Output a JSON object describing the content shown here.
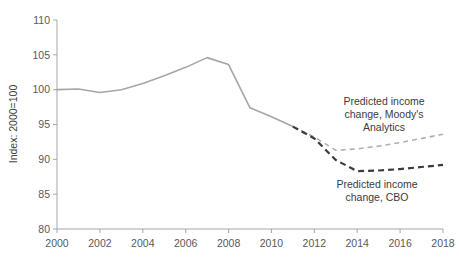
{
  "chart_data": {
    "type": "line",
    "title": "",
    "xlabel": "",
    "ylabel": "Index: 2000=100",
    "xlim": [
      2000,
      2018
    ],
    "ylim": [
      80,
      110
    ],
    "yticks": [
      80,
      85,
      90,
      95,
      100,
      105,
      110
    ],
    "xticks": [
      2000,
      2002,
      2004,
      2006,
      2008,
      2010,
      2012,
      2014,
      2016,
      2018
    ],
    "grid": false,
    "legend": "annotations",
    "series": [
      {
        "name": "Historical income",
        "style": "solid",
        "color": "#a6a6a6",
        "width": 1.6,
        "x": [
          2000,
          2001,
          2002,
          2003,
          2004,
          2005,
          2006,
          2007,
          2008,
          2009,
          2010,
          2011
        ],
        "values": [
          100.0,
          100.1,
          99.6,
          100.0,
          100.9,
          102.0,
          103.2,
          104.6,
          103.6,
          97.4,
          96.1,
          94.7
        ]
      },
      {
        "name": "Predicted income change, Moody's Analytics",
        "style": "dashed",
        "color": "#b0b0b0",
        "width": 1.6,
        "x": [
          2011,
          2012,
          2013,
          2014,
          2015,
          2016,
          2017,
          2018
        ],
        "values": [
          94.7,
          93.2,
          91.3,
          91.5,
          91.9,
          92.4,
          93.0,
          93.6
        ]
      },
      {
        "name": "Predicted income change, CBO",
        "style": "dashed",
        "color": "#3b3b3b",
        "width": 2.2,
        "x": [
          2011,
          2012,
          2013,
          2014,
          2015,
          2016,
          2017,
          2018
        ],
        "values": [
          94.7,
          93.0,
          89.9,
          88.3,
          88.4,
          88.6,
          88.9,
          89.2
        ]
      }
    ],
    "annotations": [
      {
        "id": "moodys",
        "lines": [
          "Predicted income",
          "change, Moody's",
          "Analytics"
        ],
        "x": 2016.0,
        "y": 98.3
      },
      {
        "id": "cbo",
        "lines": [
          "Predicted income",
          "change, CBO"
        ],
        "x": 2015.6,
        "y": 86.2
      }
    ]
  },
  "axis": {
    "y_title": "Index: 2000=100",
    "y_labels": [
      "110",
      "105",
      "100",
      "95",
      "90",
      "85",
      "80"
    ],
    "x_labels": [
      "2000",
      "2002",
      "2004",
      "2006",
      "2008",
      "2010",
      "2012",
      "2014",
      "2016",
      "2018"
    ]
  },
  "annotations": {
    "moodys_line1": "Predicted income",
    "moodys_line2": "change, Moody's",
    "moodys_line3": "Analytics",
    "cbo_line1": "Predicted income",
    "cbo_line2": "change, CBO"
  },
  "colors": {
    "historical": "#a6a6a6",
    "moodys": "#b0b0b0",
    "cbo": "#3b3b3b",
    "axis": "#a6a6a6",
    "tick_text": "#595959",
    "annotation_text": "#3b3b3b"
  }
}
